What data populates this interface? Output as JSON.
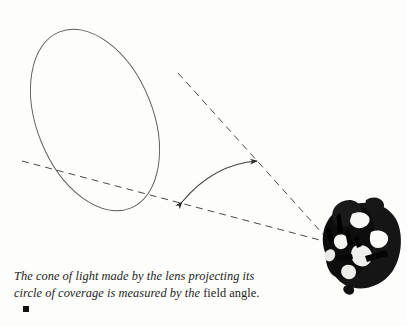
{
  "figure": {
    "background_color": "#fdfdfc",
    "line_color": "#555555",
    "ink_color": "#111111",
    "elements": {
      "coverage_circle": {
        "name": "circle of coverage",
        "shape": "tilted ellipse",
        "center_x": 95,
        "center_y": 120,
        "radius_x": 58,
        "radius_y": 95,
        "rotation_deg": -22
      },
      "upper_ray": {
        "name": "upper cone edge",
        "style": "dashed",
        "x1": 178,
        "y1": 73,
        "x2": 331,
        "y2": 243
      },
      "lower_ray": {
        "name": "lower cone edge",
        "style": "dashed",
        "x1": 22,
        "y1": 161,
        "x2": 331,
        "y2": 243
      },
      "angle_arc": {
        "name": "field angle arc",
        "style": "double-headed curved arrow",
        "from_x": 181,
        "from_y": 203,
        "to_x": 258,
        "to_y": 160
      },
      "lens": {
        "name": "camera lens",
        "center_x": 359,
        "center_y": 249,
        "description": "high-contrast black camera lens barrel viewed at an angle"
      }
    }
  },
  "caption": {
    "line1_italic": "The cone of light made by the lens projecting its",
    "line2_italic": "circle of coverage is measured by the ",
    "line2_roman": "field angle.",
    "endmark": "■"
  }
}
